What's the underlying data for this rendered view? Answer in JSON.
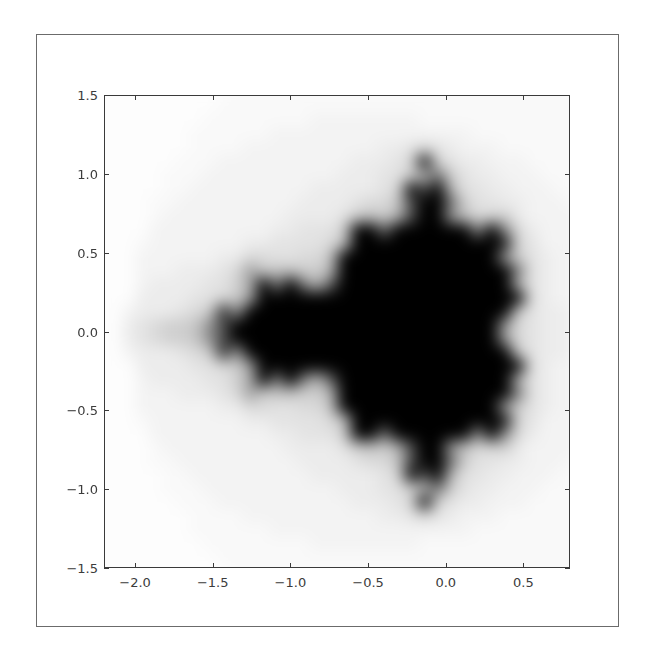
{
  "chart_data": {
    "type": "heatmap",
    "title": "",
    "xlabel": "",
    "ylabel": "",
    "xlim": [
      -2.2,
      0.8
    ],
    "ylim": [
      -1.5,
      1.5
    ],
    "x_ticks": [
      -2.0,
      -1.5,
      -1.0,
      -0.5,
      0.0,
      0.5
    ],
    "x_tick_labels": [
      "−2.0",
      "−1.5",
      "−1.0",
      "−0.5",
      "0.0",
      "0.5"
    ],
    "y_ticks": [
      1.5,
      1.0,
      0.5,
      0.0,
      -0.5,
      -1.0,
      -1.5
    ],
    "y_tick_labels": [
      "1.5",
      "1.0",
      "0.5",
      "0.0",
      "−0.5",
      "−1.0",
      "−1.5"
    ],
    "colormap": "gray_r",
    "grid_resolution": 36,
    "max_iterations": 20,
    "grid": false,
    "legend": null
  }
}
